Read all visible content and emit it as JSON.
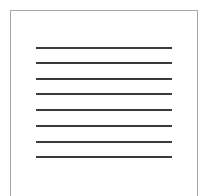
{
  "icon": {
    "name": "document-lines-icon",
    "border_color": "#a8a8a8",
    "line_color": "#3a3a3a",
    "background": "#ffffff",
    "line_count": 8,
    "lines": [
      {
        "y": 47
      },
      {
        "y": 62
      },
      {
        "y": 78
      },
      {
        "y": 93
      },
      {
        "y": 109
      },
      {
        "y": 125
      },
      {
        "y": 141
      },
      {
        "y": 156
      }
    ]
  }
}
